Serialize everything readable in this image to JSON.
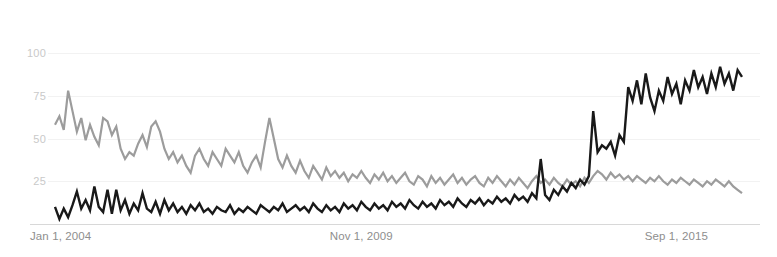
{
  "chart_data": {
    "type": "line",
    "title": "",
    "subtitle": "",
    "xlabel": "",
    "ylabel": "",
    "ylim": [
      0,
      108
    ],
    "yticks": [
      25,
      50,
      75,
      100
    ],
    "ytick_labels": [
      "25",
      "50",
      "75",
      "100"
    ],
    "grid": true,
    "grid_axis": "y",
    "legend_position": "none",
    "xtick_labels": [
      "Jan 1, 2004",
      "Nov 1, 2009",
      "Sep 1, 2015"
    ],
    "xtick_positions": [
      0,
      70,
      142
    ],
    "x_count": 155,
    "x_description": "Monthly points from Jan 1, 2004 through approximately Nov 2016",
    "annotations": [],
    "series": [
      {
        "name": "series-gray",
        "color": "#9c9c9c",
        "stroke_width": 2.2,
        "values": [
          58,
          63,
          55,
          78,
          66,
          54,
          62,
          49,
          58,
          51,
          46,
          62,
          60,
          52,
          57,
          44,
          38,
          42,
          40,
          47,
          52,
          45,
          57,
          60,
          54,
          44,
          38,
          42,
          36,
          40,
          34,
          30,
          40,
          44,
          38,
          34,
          42,
          38,
          34,
          44,
          40,
          36,
          42,
          34,
          30,
          36,
          40,
          33,
          48,
          62,
          50,
          38,
          33,
          40,
          34,
          30,
          37,
          31,
          27,
          34,
          30,
          26,
          33,
          28,
          31,
          27,
          30,
          25,
          29,
          27,
          31,
          27,
          24,
          29,
          26,
          30,
          25,
          28,
          24,
          27,
          30,
          25,
          23,
          28,
          26,
          22,
          28,
          24,
          27,
          23,
          26,
          29,
          24,
          27,
          23,
          26,
          28,
          24,
          22,
          27,
          24,
          28,
          25,
          22,
          26,
          23,
          27,
          24,
          21,
          25,
          28,
          24,
          26,
          23,
          27,
          24,
          22,
          26,
          23,
          25,
          22,
          27,
          24,
          28,
          31,
          29,
          26,
          30,
          27,
          29,
          26,
          28,
          25,
          28,
          26,
          24,
          27,
          25,
          28,
          25,
          23,
          26,
          24,
          27,
          25,
          23,
          26,
          24,
          22,
          25,
          23,
          26,
          24,
          22,
          25,
          22,
          20,
          18
        ]
      },
      {
        "name": "series-black",
        "color": "#191919",
        "stroke_width": 2.4,
        "values": [
          10,
          3,
          9,
          4,
          11,
          19,
          9,
          14,
          8,
          22,
          10,
          7,
          20,
          6,
          20,
          8,
          14,
          6,
          12,
          8,
          18,
          9,
          7,
          13,
          6,
          14,
          8,
          12,
          7,
          10,
          6,
          11,
          8,
          12,
          7,
          9,
          6,
          10,
          8,
          7,
          11,
          6,
          9,
          7,
          10,
          8,
          6,
          11,
          9,
          7,
          10,
          8,
          12,
          7,
          9,
          11,
          8,
          10,
          7,
          12,
          9,
          7,
          11,
          8,
          10,
          7,
          12,
          9,
          11,
          8,
          13,
          10,
          8,
          12,
          9,
          11,
          8,
          13,
          10,
          12,
          9,
          14,
          11,
          9,
          13,
          10,
          12,
          9,
          14,
          11,
          13,
          10,
          15,
          12,
          10,
          14,
          12,
          15,
          11,
          14,
          12,
          16,
          13,
          15,
          12,
          17,
          14,
          16,
          13,
          18,
          15,
          38,
          17,
          14,
          20,
          17,
          22,
          19,
          24,
          21,
          26,
          23,
          28,
          66,
          42,
          46,
          44,
          48,
          40,
          52,
          48,
          80,
          72,
          84,
          70,
          88,
          74,
          66,
          78,
          72,
          86,
          76,
          82,
          70,
          84,
          78,
          90,
          80,
          86,
          76,
          88,
          80,
          92,
          82,
          88,
          78,
          90,
          86
        ]
      }
    ]
  },
  "axis": {
    "y_labels": [
      "100",
      "75",
      "50",
      "25"
    ],
    "x_labels": [
      "Jan 1, 2004",
      "Nov 1, 2009",
      "Sep 1, 2015"
    ]
  },
  "colors": {
    "background": "#ffffff",
    "gridline": "#f2f2f2",
    "axisline": "#d8d8d8",
    "ytick_text": "#c9c9c9",
    "xtick_text": "#8e8e8e",
    "series_gray": "#9c9c9c",
    "series_black": "#191919"
  }
}
